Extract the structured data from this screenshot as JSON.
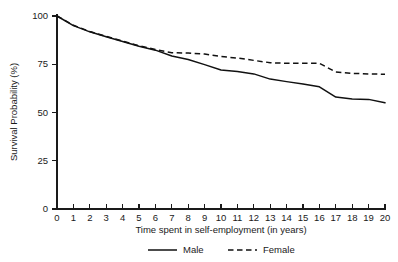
{
  "chart_data": {
    "type": "line",
    "title": "",
    "xlabel": "Time spent in self-employment (in years)",
    "ylabel": "Survival Probability (%)",
    "xlim": [
      0,
      20
    ],
    "ylim": [
      0,
      100
    ],
    "grid": false,
    "legend_position": "bottom",
    "x_ticks": [
      "0",
      "1",
      "2",
      "3",
      "4",
      "5",
      "6",
      "7",
      "8",
      "9",
      "10",
      "11",
      "12",
      "13",
      "14",
      "15",
      "16",
      "17",
      "18",
      "19",
      "20"
    ],
    "y_ticks": [
      "0",
      "25",
      "50",
      "75",
      "100"
    ],
    "x": [
      0,
      1,
      2,
      3,
      4,
      5,
      6,
      7,
      8,
      9,
      10,
      11,
      12,
      13,
      14,
      15,
      16,
      17,
      18,
      19,
      20
    ],
    "series": [
      {
        "name": "Male",
        "style": "solid",
        "color": "#111111",
        "values": [
          100.0,
          95.0,
          91.8,
          89.2,
          86.8,
          84.3,
          82.3,
          79.3,
          77.5,
          74.8,
          72.0,
          71.3,
          70.0,
          67.3,
          66.0,
          64.8,
          63.3,
          58.0,
          57.0,
          56.8,
          55.0
        ]
      },
      {
        "name": "Female",
        "style": "dashed",
        "color": "#111111",
        "values": [
          100.0,
          95.2,
          92.0,
          89.4,
          87.0,
          84.6,
          82.6,
          81.0,
          80.8,
          80.3,
          79.0,
          78.2,
          77.0,
          75.8,
          75.5,
          75.5,
          75.5,
          71.0,
          70.3,
          70.0,
          69.8
        ]
      }
    ]
  },
  "legend": {
    "items": [
      {
        "label": "Male",
        "style": "solid"
      },
      {
        "label": "Female",
        "style": "dashed"
      }
    ]
  }
}
